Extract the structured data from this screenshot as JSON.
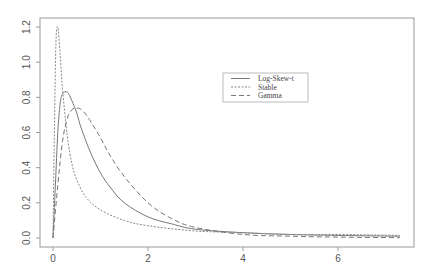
{
  "chart_data": {
    "type": "line",
    "title": "",
    "xlabel": "",
    "ylabel": "",
    "xlim": [
      -0.3,
      7.5
    ],
    "ylim": [
      -0.05,
      1.25
    ],
    "xticks": [
      "0",
      "2",
      "4",
      "6"
    ],
    "yticks": [
      "0.0",
      "0.2",
      "0.4",
      "0.6",
      "0.8",
      "1.0",
      "1.2"
    ],
    "grid": false,
    "legend_position": "upper-center-right",
    "series": [
      {
        "name": "Log-Skew-t",
        "style": "solid",
        "x": [
          0.0,
          0.05,
          0.1,
          0.15,
          0.2,
          0.3,
          0.4,
          0.5,
          0.6,
          0.8,
          1.0,
          1.2,
          1.5,
          2.0,
          2.5,
          3.0,
          4.0,
          5.0,
          6.0,
          7.3
        ],
        "y": [
          0.0,
          0.3,
          0.6,
          0.76,
          0.82,
          0.83,
          0.78,
          0.71,
          0.62,
          0.48,
          0.37,
          0.29,
          0.2,
          0.12,
          0.08,
          0.05,
          0.03,
          0.02,
          0.015,
          0.01
        ]
      },
      {
        "name": "Stable",
        "style": "dotted",
        "x": [
          0.0,
          0.03,
          0.06,
          0.1,
          0.15,
          0.2,
          0.3,
          0.4,
          0.5,
          0.7,
          1.0,
          1.5,
          2.0,
          3.0,
          4.0,
          5.0,
          6.0,
          7.3
        ],
        "y": [
          0.0,
          0.6,
          1.1,
          1.2,
          1.05,
          0.85,
          0.58,
          0.42,
          0.33,
          0.23,
          0.16,
          0.1,
          0.07,
          0.04,
          0.03,
          0.02,
          0.02,
          0.015
        ]
      },
      {
        "name": "Gamma",
        "style": "dashed",
        "x": [
          0.0,
          0.1,
          0.2,
          0.3,
          0.4,
          0.5,
          0.6,
          0.7,
          0.8,
          1.0,
          1.2,
          1.5,
          2.0,
          2.5,
          3.0,
          4.0,
          5.0,
          6.0,
          7.3
        ],
        "y": [
          0.0,
          0.3,
          0.55,
          0.68,
          0.73,
          0.74,
          0.73,
          0.7,
          0.66,
          0.57,
          0.47,
          0.35,
          0.2,
          0.11,
          0.06,
          0.02,
          0.01,
          0.005,
          0.002
        ]
      }
    ]
  }
}
